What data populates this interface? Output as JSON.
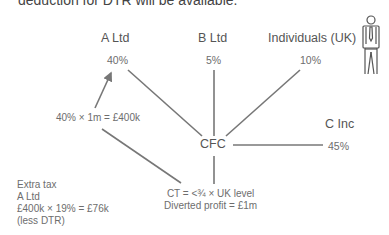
{
  "header_clipped_text": "deduction for DTR will be available.",
  "nodes": {
    "a_ltd": {
      "label": "A Ltd",
      "pct": "40%"
    },
    "b_ltd": {
      "label": "B Ltd",
      "pct": "5%"
    },
    "individuals": {
      "label": "Individuals (UK)",
      "pct": "10%",
      "icon": "person-icon"
    },
    "c_inc": {
      "label": "C Inc",
      "pct": "45%"
    },
    "cfc": {
      "label": "CFC"
    }
  },
  "annotations": {
    "apportion": "40% × 1m = £400k",
    "cfc_details": [
      "CT = <¾ × UK level",
      "Diverted profit = £1m"
    ],
    "extra_tax": [
      "Extra tax",
      "A Ltd",
      "£400k × 19% = £76k",
      "(less DTR)"
    ]
  },
  "colors": {
    "line": "#777777",
    "text": "#6a6a6a"
  }
}
